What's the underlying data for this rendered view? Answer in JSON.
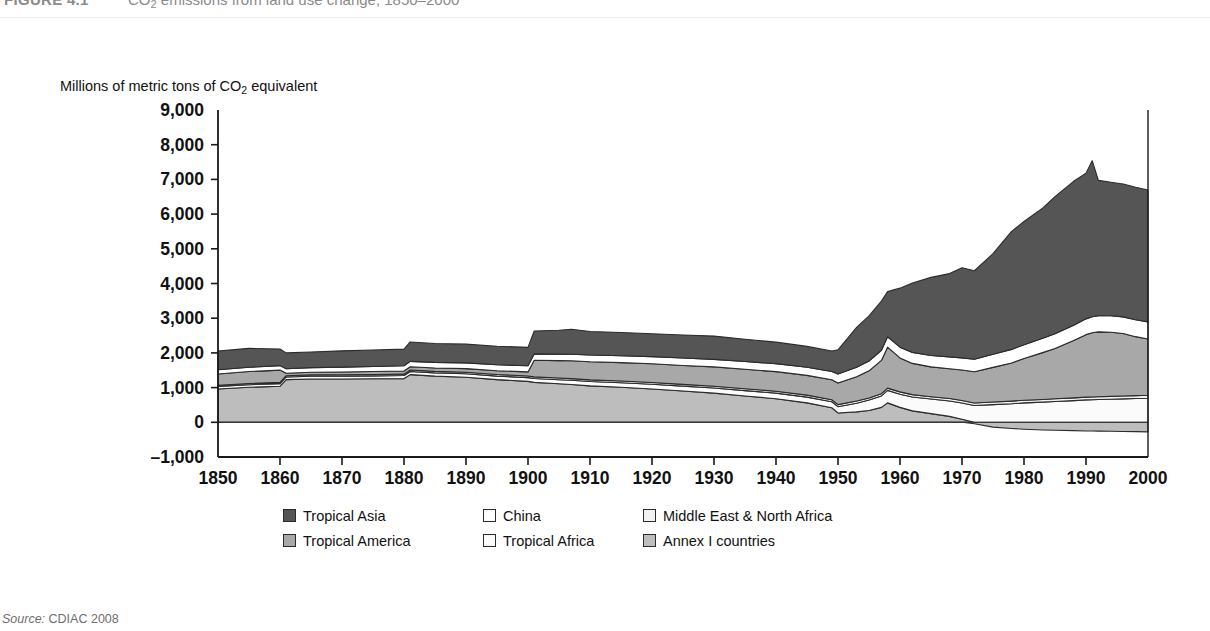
{
  "figure": {
    "number": "FIGURE 4.1",
    "title_prefix": "CO",
    "title_sub": "2",
    "title_rest": " emissions from land use change, 1850–2000"
  },
  "axis_title": {
    "prefix": "Millions of metric tons of CO",
    "sub": "2",
    "rest": " equivalent"
  },
  "source": {
    "label": "Source:",
    "text": " CDIAC 2008"
  },
  "legend": {
    "items": [
      {
        "label": "Tropical Asia",
        "color": "#555555"
      },
      {
        "label": "China",
        "color": "#ffffff"
      },
      {
        "label": "Middle East & North Africa",
        "color": "#f2f2f2"
      },
      {
        "label": "Tropical America",
        "color": "#a8a8a8"
      },
      {
        "label": "Tropical Africa",
        "color": "#fbfbfb"
      },
      {
        "label": "Annex I countries",
        "color": "#bdbdbd"
      }
    ]
  },
  "chart_data": {
    "type": "area",
    "stacked": true,
    "title": "CO2 emissions from land use change, 1850–2000",
    "xlabel": "",
    "ylabel": "Millions of metric tons of CO2 equivalent",
    "xlim": [
      1850,
      2000
    ],
    "ylim": [
      -1000,
      9000
    ],
    "ytick_step": 1000,
    "xtick_step": 10,
    "grid": false,
    "zero_line": true,
    "legend_position": "bottom",
    "ytick_labels": [
      "9,000",
      "8,000",
      "7,000",
      "6,000",
      "5,000",
      "4,000",
      "3,000",
      "2,000",
      "1,000",
      "0",
      "–1,000"
    ],
    "ytick_values": [
      9000,
      8000,
      7000,
      6000,
      5000,
      4000,
      3000,
      2000,
      1000,
      0,
      -1000
    ],
    "xtick_labels": [
      "1850",
      "1860",
      "1870",
      "1880",
      "1890",
      "1900",
      "1910",
      "1920",
      "1930",
      "1940",
      "1950",
      "1960",
      "1970",
      "1980",
      "1990",
      "2000"
    ],
    "xtick_values": [
      1850,
      1860,
      1870,
      1880,
      1890,
      1900,
      1910,
      1920,
      1930,
      1940,
      1950,
      1960,
      1970,
      1980,
      1990,
      2000
    ],
    "x": [
      1850,
      1855,
      1860,
      1861,
      1865,
      1870,
      1875,
      1880,
      1881,
      1885,
      1890,
      1895,
      1900,
      1901,
      1905,
      1907,
      1910,
      1915,
      1920,
      1925,
      1930,
      1935,
      1940,
      1945,
      1949,
      1950,
      1953,
      1955,
      1957,
      1958,
      1960,
      1962,
      1965,
      1968,
      1970,
      1972,
      1975,
      1978,
      1980,
      1983,
      1985,
      1988,
      1990,
      1991,
      1992,
      1994,
      1996,
      1998,
      2000
    ],
    "series": [
      {
        "name": "Annex I countries",
        "color": "#bdbdbd",
        "values": [
          960,
          1010,
          1040,
          1230,
          1250,
          1250,
          1255,
          1260,
          1375,
          1330,
          1300,
          1230,
          1180,
          1150,
          1110,
          1090,
          1050,
          1010,
          960,
          900,
          840,
          760,
          680,
          560,
          420,
          270,
          300,
          340,
          430,
          560,
          430,
          330,
          250,
          170,
          90,
          -40,
          -140,
          -180,
          -200,
          -220,
          -230,
          -240,
          -250,
          -250,
          -255,
          -260,
          -265,
          -270,
          -275
        ]
      },
      {
        "name": "Tropical Africa",
        "color": "#fbfbfb",
        "values": [
          70,
          72,
          74,
          76,
          78,
          80,
          84,
          88,
          90,
          94,
          98,
          102,
          108,
          112,
          118,
          120,
          124,
          130,
          136,
          142,
          148,
          154,
          160,
          166,
          172,
          180,
          250,
          300,
          330,
          360,
          380,
          400,
          420,
          445,
          465,
          485,
          510,
          535,
          560,
          580,
          600,
          625,
          645,
          650,
          655,
          665,
          675,
          685,
          695
        ]
      },
      {
        "name": "Middle East & North Africa",
        "color": "#f2f2f2",
        "values": [
          34,
          35,
          36,
          37,
          38,
          39,
          40,
          41,
          42,
          43,
          44,
          45,
          46,
          47,
          48,
          48,
          49,
          50,
          51,
          52,
          53,
          54,
          55,
          56,
          57,
          60,
          62,
          63,
          64,
          65,
          66,
          67,
          68,
          70,
          71,
          72,
          74,
          76,
          77,
          78,
          79,
          80,
          81,
          81,
          82,
          82,
          83,
          83,
          84
        ]
      },
      {
        "name": "Tropical America",
        "color": "#a8a8a8",
        "values": [
          330,
          345,
          355,
          70,
          75,
          80,
          85,
          90,
          95,
          100,
          105,
          110,
          118,
          480,
          500,
          515,
          520,
          530,
          540,
          545,
          555,
          560,
          565,
          570,
          575,
          620,
          700,
          780,
          960,
          1180,
          980,
          900,
          860,
          860,
          880,
          900,
          1000,
          1100,
          1200,
          1350,
          1450,
          1650,
          1800,
          1850,
          1870,
          1850,
          1800,
          1700,
          1620
        ]
      },
      {
        "name": "China",
        "color": "#ffffff",
        "values": [
          120,
          124,
          128,
          132,
          136,
          140,
          145,
          150,
          154,
          160,
          165,
          170,
          178,
          182,
          188,
          190,
          195,
          200,
          206,
          212,
          218,
          224,
          230,
          236,
          242,
          260,
          272,
          282,
          292,
          300,
          310,
          318,
          328,
          340,
          350,
          360,
          375,
          390,
          400,
          415,
          425,
          440,
          455,
          460,
          465,
          472,
          480,
          488,
          496
        ]
      },
      {
        "name": "Tropical Asia",
        "color": "#555555",
        "values": [
          540,
          545,
          480,
          455,
          450,
          470,
          475,
          480,
          560,
          545,
          540,
          535,
          530,
          660,
          690,
          720,
          680,
          670,
          660,
          665,
          670,
          640,
          620,
          600,
          590,
          700,
          1150,
          1300,
          1420,
          1300,
          1700,
          2000,
          2250,
          2400,
          2600,
          2550,
          2900,
          3400,
          3550,
          3750,
          3950,
          4150,
          4200,
          4500,
          3900,
          3850,
          3830,
          3820,
          3800
        ]
      }
    ]
  }
}
